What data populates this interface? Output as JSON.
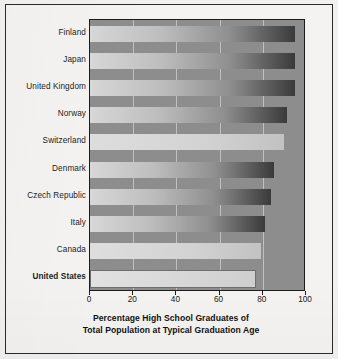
{
  "chart_data": {
    "type": "bar",
    "orientation": "horizontal",
    "title": "",
    "xlabel": "Percentage High School Graduates of Total Population at Typical Graduation Age",
    "ylabel": "",
    "xlim": [
      0,
      100
    ],
    "xticks": [
      0,
      20,
      40,
      60,
      80,
      100
    ],
    "grid": true,
    "legend": false,
    "categories": [
      "Finland",
      "Japan",
      "United Kingdom",
      "Norway",
      "Switzerland",
      "Denmark",
      "Czech Republic",
      "Italy",
      "Canada",
      "United States"
    ],
    "values": [
      95,
      95,
      95,
      91,
      90,
      85,
      84,
      81,
      79,
      76
    ],
    "highlight_category": "United States",
    "bars": [
      {
        "label": "Finland",
        "value": 95,
        "style": "gradient",
        "highlighted": false
      },
      {
        "label": "Japan",
        "value": 95,
        "style": "gradient",
        "highlighted": false
      },
      {
        "label": "United Kingdom",
        "value": 95,
        "style": "gradient",
        "highlighted": false
      },
      {
        "label": "Norway",
        "value": 91,
        "style": "gradient",
        "highlighted": false
      },
      {
        "label": "Switzerland",
        "value": 90,
        "style": "flat",
        "highlighted": false
      },
      {
        "label": "Denmark",
        "value": 85,
        "style": "gradient",
        "highlighted": false
      },
      {
        "label": "Czech Republic",
        "value": 84,
        "style": "gradient",
        "highlighted": false
      },
      {
        "label": "Italy",
        "value": 81,
        "style": "gradient",
        "highlighted": false
      },
      {
        "label": "Canada",
        "value": 79,
        "style": "flat",
        "highlighted": false
      },
      {
        "label": "United States",
        "value": 76,
        "style": "outlined",
        "highlighted": true
      }
    ]
  },
  "axis_title": {
    "line1": "Percentage High School Graduates of",
    "line2": "Total Population at Typical Graduation Age"
  },
  "colors": {
    "page_background": "#f2f1ef",
    "frame": "#2b2b2b",
    "plot_background": "#8d8d8d",
    "gridline": "#ebebeb",
    "text": "#1d1d1d",
    "bar_light": "#d8d8d8",
    "bar_dark": "#3a3a3a"
  }
}
